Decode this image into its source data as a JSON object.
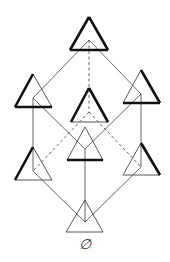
{
  "diagram": {
    "type": "hasse-diagram",
    "bottom_label": "∅",
    "colors": {
      "edge": "#555555",
      "thin_side": "#444444",
      "thick_side": "#111111"
    },
    "nodes": [
      {
        "id": "top",
        "level": 3,
        "apex": [
          89,
          17
        ],
        "inner": [
          89,
          40
        ],
        "thick_sides": [
          "left",
          "right",
          "base"
        ]
      },
      {
        "id": "left2",
        "level": 2,
        "apex": [
          33,
          74
        ],
        "inner": [
          33,
          98
        ],
        "thick_sides": [
          "left",
          "base"
        ]
      },
      {
        "id": "center2",
        "level": 2,
        "apex": [
          89,
          88
        ],
        "inner": [
          89,
          112
        ],
        "thick_sides": [
          "left",
          "right"
        ]
      },
      {
        "id": "right2",
        "level": 2,
        "apex": [
          141,
          70
        ],
        "inner": [
          141,
          94
        ],
        "thick_sides": [
          "right",
          "base"
        ]
      },
      {
        "id": "left1",
        "level": 1,
        "apex": [
          33,
          147
        ],
        "inner": [
          33,
          171
        ],
        "thick_sides": [
          "left"
        ]
      },
      {
        "id": "center1",
        "level": 1,
        "apex": [
          85,
          127
        ],
        "inner": [
          85,
          149
        ],
        "thick_sides": [
          "base"
        ]
      },
      {
        "id": "right1",
        "level": 1,
        "apex": [
          141,
          143
        ],
        "inner": [
          141,
          167
        ],
        "thick_sides": [
          "right"
        ]
      },
      {
        "id": "bottom",
        "level": 0,
        "apex": [
          85,
          200
        ],
        "inner": [
          85,
          222
        ],
        "thick_sides": []
      }
    ],
    "edges": [
      {
        "from": "top",
        "to": "left2",
        "style": "solid"
      },
      {
        "from": "top",
        "to": "right2",
        "style": "solid"
      },
      {
        "from": "top",
        "to": "center2",
        "style": "dashed"
      },
      {
        "from": "left2",
        "to": "left1",
        "style": "solid"
      },
      {
        "from": "left2",
        "to": "center1",
        "style": "solid"
      },
      {
        "from": "right2",
        "to": "right1",
        "style": "solid"
      },
      {
        "from": "right2",
        "to": "center1",
        "style": "solid"
      },
      {
        "from": "center2",
        "to": "left1",
        "style": "dashed"
      },
      {
        "from": "center2",
        "to": "right1",
        "style": "dashed"
      },
      {
        "from": "left1",
        "to": "bottom",
        "style": "solid"
      },
      {
        "from": "center1",
        "to": "bottom",
        "style": "solid"
      },
      {
        "from": "right1",
        "to": "bottom",
        "style": "solid"
      }
    ]
  }
}
